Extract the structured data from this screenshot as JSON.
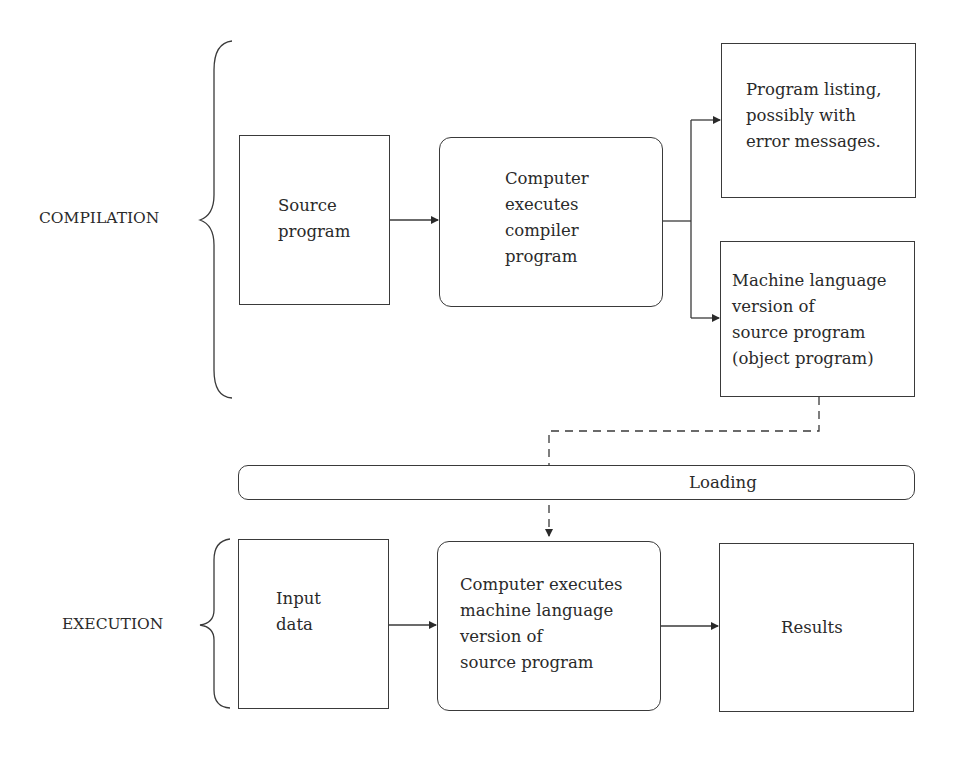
{
  "diagram": {
    "sections": {
      "compilation": {
        "label": "COMPILATION"
      },
      "execution": {
        "label": "EXECUTION"
      }
    },
    "nodes": {
      "source_program": {
        "text": "Source\nprogram"
      },
      "compiler": {
        "text": "Computer\nexecutes\ncompiler\nprogram"
      },
      "program_listing": {
        "text": "Program listing,\npossibly with\nerror messages."
      },
      "object_program": {
        "text": "Machine language\nversion of\nsource program\n(object program)"
      },
      "loading": {
        "text": "Loading"
      },
      "input_data": {
        "text": "Input\ndata"
      },
      "executes_machine": {
        "text": "Computer executes\nmachine language\nversion of\nsource program"
      },
      "results": {
        "text": "Results"
      }
    },
    "edges": [
      {
        "from": "source_program",
        "to": "compiler",
        "style": "solid"
      },
      {
        "from": "compiler",
        "to": "program_listing",
        "style": "solid"
      },
      {
        "from": "compiler",
        "to": "object_program",
        "style": "solid"
      },
      {
        "from": "object_program",
        "to": "executes_machine",
        "style": "dashed",
        "via": "loading"
      },
      {
        "from": "input_data",
        "to": "executes_machine",
        "style": "solid"
      },
      {
        "from": "executes_machine",
        "to": "results",
        "style": "solid"
      }
    ],
    "colors": {
      "stroke": "#3a3a3a",
      "text": "#2a2a2a",
      "background": "#ffffff"
    }
  }
}
